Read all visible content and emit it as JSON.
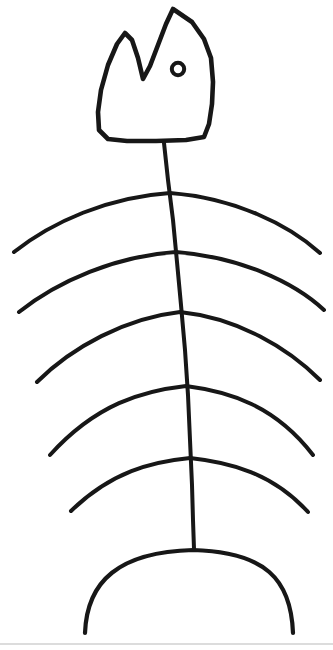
{
  "canvas": {
    "width": 333,
    "height": 650,
    "background_color": "#ffffff",
    "ink_color": "#171717",
    "hairline_color": "#b9b9b9",
    "title": "Hand-drawn fish skeleton sketch"
  },
  "drawing": {
    "subject": "fish-bone",
    "style": "hand-drawn black ink line art",
    "stroke_width": 4,
    "parts": [
      {
        "name": "head",
        "label": "Fish head outline with two peaks"
      },
      {
        "name": "eye",
        "label": "Eye"
      },
      {
        "name": "spine",
        "label": "Backbone"
      },
      {
        "name": "ribs",
        "label": "Rib arcs",
        "count": 5
      },
      {
        "name": "tail",
        "label": "Tail dome arc"
      },
      {
        "name": "baseline",
        "label": "Bottom hairline"
      }
    ]
  },
  "chart_data": {
    "type": "line",
    "xlabel": "",
    "ylabel": "",
    "xlim": [
      0,
      333
    ],
    "ylim": [
      0,
      650
    ],
    "grid": false,
    "legend": "none",
    "series": [
      {
        "name": "head-outline",
        "closed": true,
        "path": "M 173 9 L 192 22 L 204 39 L 211 58 L 213 82 L 212 104 L 209 124 L 204 137 L 186 140 L 156 141 L 127 141 L 108 139 L 99 130 L 98 112 L 101 90 L 108 65 L 117 44 L 125 33 L 132 40 L 138 58 L 143 79 L 150 66 L 158 45 L 166 24 Z"
      },
      {
        "name": "eye",
        "shape": "circle",
        "cx": 178,
        "cy": 69,
        "r": 6.2
      },
      {
        "name": "spine",
        "path": "M 164 143 L 168 180 L 173 220 L 177 262 L 181 305 L 185 350 L 188 395 L 190 440 L 192 485 L 193 520 L 194 549"
      },
      {
        "name": "rib-1",
        "junction": [
          170,
          193
        ],
        "left_end": [
          14,
          252
        ],
        "right_end": [
          320,
          253
        ],
        "path": "M 14 252 C 52 222 108 197 170 193 C 234 198 288 224 320 253"
      },
      {
        "name": "rib-2",
        "junction": [
          176,
          252
        ],
        "left_end": [
          19,
          312
        ],
        "right_end": [
          324,
          310
        ],
        "path": "M 19 312 C 58 281 116 256 176 252 C 240 257 294 282 324 310"
      },
      {
        "name": "rib-3",
        "junction": [
          180,
          312
        ],
        "left_end": [
          37,
          382
        ],
        "right_end": [
          320,
          380
        ],
        "path": "M 37 382 C 72 347 126 318 180 312 C 238 318 288 348 320 380"
      },
      {
        "name": "rib-4",
        "junction": [
          186,
          386
        ],
        "left_end": [
          50,
          455
        ],
        "right_end": [
          313,
          455
        ]
      },
      {
        "name": "rib-5",
        "junction": [
          190,
          458
        ],
        "left_end": [
          71,
          511
        ],
        "right_end": [
          308,
          512
        ]
      },
      {
        "name": "tail-arc",
        "left_end": [
          85,
          633
        ],
        "apex": [
          193,
          550
        ],
        "right_end": [
          293,
          633
        ]
      },
      {
        "name": "baseline",
        "y": 644,
        "x_start": 0,
        "x_end": 333
      }
    ]
  }
}
